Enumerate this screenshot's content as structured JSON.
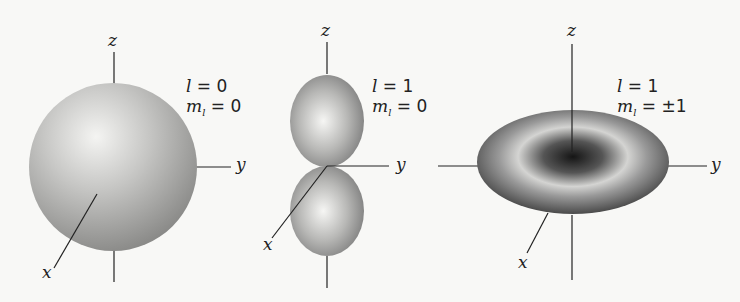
{
  "diagram": {
    "type": "atomic orbital shapes",
    "axis_labels": {
      "z": "z",
      "y": "y",
      "x": "x"
    },
    "panels": [
      {
        "id": "s",
        "shape": "sphere",
        "l_label": "l = 0",
        "ml_label": "m",
        "l_value": "0",
        "ml_value": "0"
      },
      {
        "id": "p0",
        "shape": "dumbbell",
        "l_value": "1",
        "ml_value": "0"
      },
      {
        "id": "p1",
        "shape": "torus",
        "l_value": "1",
        "ml_value": "±1"
      }
    ],
    "symbols": {
      "l": "l",
      "m": "m",
      "sub": "l",
      "eq": " = "
    }
  }
}
